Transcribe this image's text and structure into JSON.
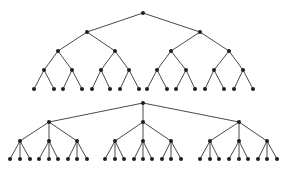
{
  "diagram": {
    "title": "",
    "colors": {
      "edge": "#4a4a4a",
      "node": "#1e1e1e",
      "background": "#ffffff"
    },
    "node_radius": 2,
    "trees": [
      {
        "name": "binary-tree",
        "branching": 2,
        "depth": 4,
        "root": {
          "x": 143,
          "y": 13
        },
        "level_y": [
          13,
          32,
          51,
          70,
          89
        ],
        "level_x": [
          [
            143
          ],
          [
            87,
            200
          ],
          [
            58,
            115,
            171,
            229
          ],
          [
            44,
            72,
            101,
            129,
            157,
            186,
            214,
            243
          ],
          [
            34,
            54,
            63,
            82,
            92,
            110,
            120,
            139,
            147,
            167,
            176,
            195,
            205,
            224,
            234,
            253
          ]
        ]
      },
      {
        "name": "ternary-tree",
        "branching": 3,
        "depth": 3,
        "root": {
          "x": 143,
          "y": 103
        },
        "level_y": [
          103,
          122,
          141,
          159
        ],
        "level_x": [
          [
            143
          ],
          [
            49,
            143,
            239
          ],
          [
            20,
            49,
            77,
            115,
            143,
            171,
            210,
            239,
            267
          ],
          [
            10,
            20,
            30,
            39,
            49,
            58,
            68,
            77,
            87,
            105,
            115,
            124,
            134,
            143,
            152,
            162,
            171,
            181,
            200,
            210,
            219,
            229,
            239,
            248,
            258,
            267,
            277
          ]
        ]
      }
    ]
  }
}
